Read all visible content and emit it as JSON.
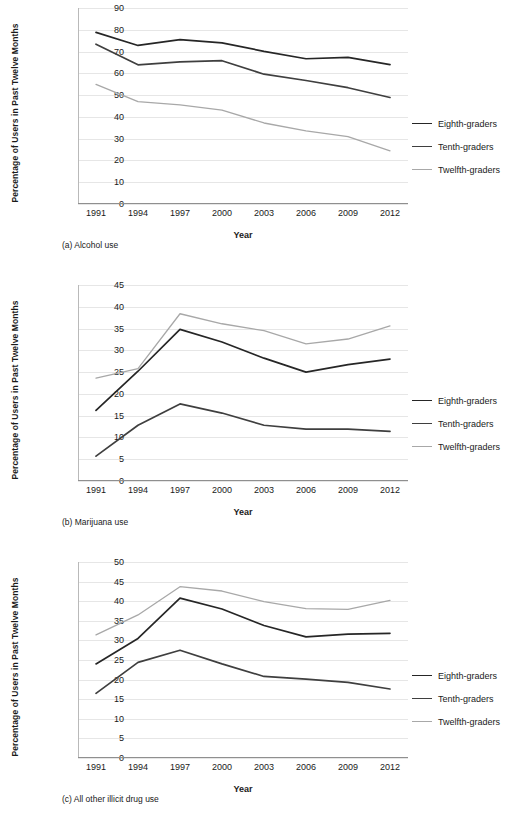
{
  "common": {
    "y_axis_title": "Percentage of Users in Past Twelve Months",
    "x_axis_title": "Year",
    "legend": [
      {
        "label": "Eighth-graders",
        "color": "#262626"
      },
      {
        "label": "Tenth-graders",
        "color": "#3f3f3f"
      },
      {
        "label": "Twelfth-graders",
        "color": "#a8a8a8"
      }
    ],
    "years": [
      "1991",
      "1994",
      "1997",
      "2000",
      "2003",
      "2006",
      "2009",
      "2012"
    ]
  },
  "chart_data": [
    {
      "type": "line",
      "panel": "a",
      "title": "(a) Alcohol use",
      "xlabel": "Year",
      "ylabel": "Percentage of Users in Past Twelve Months",
      "categories": [
        "1991",
        "1994",
        "1997",
        "2000",
        "2003",
        "2006",
        "2009",
        "2012"
      ],
      "ylim": [
        0,
        90
      ],
      "yticks": [
        90,
        80,
        70,
        60,
        50,
        40,
        30,
        20,
        10,
        0
      ],
      "grid": true,
      "legend_position": "right",
      "series": [
        {
          "name": "Eighth-graders",
          "color": "#262626",
          "values": [
            78.8,
            72.8,
            75.5,
            74.0,
            70.1,
            66.7,
            67.3,
            64.0
          ]
        },
        {
          "name": "Tenth-graders",
          "color": "#3f3f3f",
          "values": [
            73.4,
            63.9,
            65.3,
            65.8,
            59.6,
            56.7,
            53.4,
            48.9
          ]
        },
        {
          "name": "Twelfth-graders",
          "color": "#a8a8a8",
          "values": [
            54.9,
            47.0,
            45.5,
            43.1,
            37.2,
            33.6,
            30.9,
            24.4
          ]
        }
      ]
    },
    {
      "type": "line",
      "panel": "b",
      "title": "(b) Marijuana use",
      "xlabel": "Year",
      "ylabel": "Percentage of Users in Past Twelve Months",
      "categories": [
        "1991",
        "1994",
        "1997",
        "2000",
        "2003",
        "2006",
        "2009",
        "2012"
      ],
      "ylim": [
        0,
        45
      ],
      "yticks": [
        45,
        40,
        35,
        30,
        25,
        20,
        15,
        10,
        5,
        0
      ],
      "grid": true,
      "legend_position": "right",
      "series": [
        {
          "name": "Eighth-graders",
          "color": "#262626",
          "values": [
            16.2,
            25.2,
            34.8,
            31.9,
            28.2,
            25.0,
            26.7,
            28.0
          ]
        },
        {
          "name": "Tenth-graders",
          "color": "#3f3f3f",
          "values": [
            5.7,
            12.8,
            17.7,
            15.6,
            12.8,
            11.9,
            11.9,
            11.4
          ]
        },
        {
          "name": "Twelfth-graders",
          "color": "#a8a8a8",
          "values": [
            23.6,
            25.8,
            38.4,
            36.1,
            34.5,
            31.5,
            32.6,
            35.6
          ]
        }
      ]
    },
    {
      "type": "line",
      "panel": "c",
      "title": "(c) All other illicit drug use",
      "xlabel": "Year",
      "ylabel": "Percentage of Users in Past Twelve Months",
      "categories": [
        "1991",
        "1994",
        "1997",
        "2000",
        "2003",
        "2006",
        "2009",
        "2012"
      ],
      "ylim": [
        0,
        50
      ],
      "yticks": [
        50,
        45,
        40,
        35,
        30,
        25,
        20,
        15,
        10,
        5,
        0
      ],
      "grid": true,
      "legend_position": "right",
      "series": [
        {
          "name": "Eighth-graders",
          "color": "#262626",
          "values": [
            24.0,
            30.5,
            40.8,
            38.0,
            33.8,
            30.9,
            31.6,
            31.8
          ]
        },
        {
          "name": "Tenth-graders",
          "color": "#3f3f3f",
          "values": [
            16.5,
            24.4,
            27.5,
            24.0,
            20.8,
            20.1,
            19.3,
            17.6
          ]
        },
        {
          "name": "Twelfth-graders",
          "color": "#a8a8a8",
          "values": [
            31.4,
            36.5,
            43.7,
            42.6,
            39.9,
            38.1,
            37.9,
            40.2
          ]
        }
      ]
    }
  ]
}
